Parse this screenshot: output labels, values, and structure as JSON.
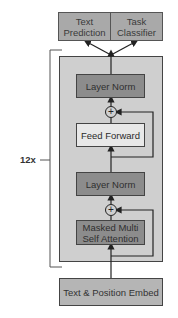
{
  "diagram": {
    "repeat_label": "12x",
    "outputs": [
      {
        "label": "Text Prediction"
      },
      {
        "label": "Task Classifier"
      }
    ],
    "block": {
      "layers": [
        {
          "label": "Layer Norm",
          "style": "dark"
        },
        {
          "label": "Feed Forward",
          "style": "light"
        },
        {
          "label": "Layer Norm",
          "style": "dark"
        },
        {
          "label": "Masked Multi Self Attention",
          "style": "dark"
        }
      ],
      "residual_add_symbol": "+"
    },
    "input": {
      "label": "Text & Position Embed"
    },
    "colors": {
      "output_box": "#a9a9a9",
      "block_bg": "#cfcfcf",
      "dark_layer": "#8c8c8c",
      "light_layer": "#e8e8e8",
      "embed_box": "#b5b5b5",
      "line": "#333333"
    }
  }
}
